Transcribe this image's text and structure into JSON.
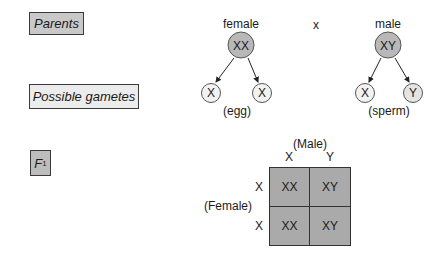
{
  "labels": {
    "parents": "Parents",
    "gametes": "Possible gametes",
    "f1_main": "F",
    "f1_sub": "1"
  },
  "parents": {
    "female": {
      "label": "female",
      "genotype": "XX"
    },
    "cross_symbol": "x",
    "male": {
      "label": "male",
      "genotype": "XY"
    }
  },
  "gametes": {
    "female": {
      "alleles": [
        "X",
        "X"
      ],
      "caption": "(egg)"
    },
    "male": {
      "alleles": [
        "X",
        "Y"
      ],
      "caption": "(sperm)"
    }
  },
  "punnett": {
    "col_title": "(Male)",
    "row_title": "(Female)",
    "col_headers": [
      "X",
      "Y"
    ],
    "row_headers": [
      "X",
      "X"
    ],
    "cells": [
      [
        "XX",
        "XY"
      ],
      [
        "XX",
        "XY"
      ]
    ]
  },
  "colors": {
    "parent_fill": "#b8b8b8",
    "grid_fill": "#aaaaaa",
    "gamete_fill": "#f2f2f2"
  }
}
